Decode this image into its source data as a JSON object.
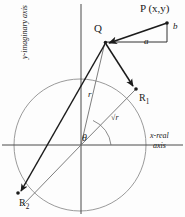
{
  "figure": {
    "colors": {
      "ink": "#1b1b1b",
      "axis": "#4a4a4a",
      "circle": "#8a8a8a",
      "thin_ray": "#6f6f6f",
      "background": "#fdfdfd"
    }
  },
  "labels": {
    "point_p": "P (x,y)",
    "point_q": "Q",
    "point_r1": "R",
    "point_r1_sub": "1",
    "point_r2": "R",
    "point_r2_sub": "2",
    "leg_a": "a",
    "leg_b": "b",
    "radius_r": "r",
    "radius_sqrt_r": "√r",
    "angle_theta": "θ",
    "x_axis_line1": "x-real",
    "x_axis_line2": "axis",
    "y_axis": "y-imaginary axis"
  },
  "geometry": {
    "origin": {
      "x": 81,
      "y": 145
    },
    "circle": {
      "cx": 80,
      "cy": 145,
      "r": 66
    },
    "points": {
      "P": {
        "x": 167,
        "y": 23
      },
      "Q": {
        "x": 105,
        "y": 42
      },
      "R1": {
        "x": 136,
        "y": 89
      },
      "R2": {
        "x": 18,
        "y": 193
      },
      "corner_ab": {
        "x": 167,
        "y": 42
      }
    },
    "x_axis": {
      "x1": 2,
      "y1": 145,
      "x2": 183,
      "y2": 145
    },
    "y_axis": {
      "x1": 81,
      "y1": 4,
      "x2": 81,
      "y2": 214
    },
    "angle_arc_radius": 30
  }
}
